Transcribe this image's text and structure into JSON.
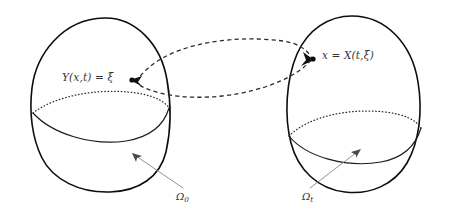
{
  "figure": {
    "background_color": "#ffffff",
    "ink_color": "#0d0d0d",
    "pointer_color": "#8c8c8c",
    "width": 456,
    "height": 220
  },
  "labels": {
    "left_point": {
      "text": "Y(x,t) = ξ",
      "function": "Y",
      "args": "(x,t)",
      "equals": "=",
      "value": "ξ"
    },
    "right_point": {
      "text": "x = X(t,ξ)",
      "variable": "x",
      "equals": "=",
      "function": "X",
      "args": "(t,ξ)"
    },
    "left_domain": {
      "symbol": "Ω",
      "subscript": "0",
      "text": "Ω₀"
    },
    "right_domain": {
      "symbol": "Ω",
      "subscript": "t",
      "text": "Ωt"
    }
  },
  "elements": {
    "left_blob": {
      "name": "reference-domain-blob",
      "description": "closed egg-shaped outline representing the reference configuration"
    },
    "right_blob": {
      "name": "current-domain-blob",
      "description": "closed egg-shaped outline representing the current configuration"
    },
    "left_equator_back": "dotted arc, hidden back edge of left domain waist",
    "left_equator_front": "solid arc, visible front edge of left domain waist",
    "right_equator_back": "dotted arc, hidden back edge of right domain waist",
    "right_equator_front": "solid arc, visible front edge of right domain waist",
    "flow_arc_upper": "dashed arc from left domain point to right domain point, arrowhead at right",
    "flow_arc_lower": "dashed arc from right domain point back to left domain point, arrowhead at left",
    "left_point_dot": "filled marker at ξ in reference domain",
    "right_point_dot": "filled marker at x in current domain",
    "left_pointer": "thin grey leader line with arrowhead from Ω₀ label into left domain",
    "right_pointer": "thin grey leader line with arrowhead from Ωt label into right domain"
  }
}
